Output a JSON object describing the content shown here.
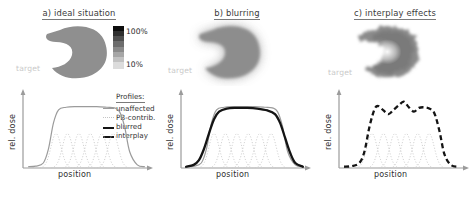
{
  "figure": {
    "panels": [
      {
        "id": "a",
        "title": "a) ideal situation",
        "target_label": "target",
        "axis": {
          "x": "position",
          "y": "rel. dose"
        }
      },
      {
        "id": "b",
        "title": "b) blurring",
        "target_label": "target",
        "axis": {
          "x": "position",
          "y": "rel. dose"
        }
      },
      {
        "id": "c",
        "title": "c) interplay effects",
        "target_label": "target",
        "axis": {
          "x": "position",
          "y": "rel. dose"
        }
      }
    ],
    "colorbar": {
      "max_label": "100%",
      "min_label": "10%",
      "max_color": "#0d0d0d",
      "min_color": "#dcdcdc"
    },
    "legend": {
      "title": "Profiles:",
      "items": [
        {
          "label": "unaffected",
          "style": "solid-thin-gray",
          "color": "#9b9b9b"
        },
        {
          "label": "PB-contrib.",
          "style": "dotted-thin-light",
          "color": "#c4c4c4"
        },
        {
          "label": "blurred",
          "style": "solid-thick-black",
          "color": "#141414"
        },
        {
          "label": "interplay",
          "style": "dashed-thick-black",
          "color": "#141414"
        }
      ]
    }
  },
  "chart_data": [
    {
      "type": "line",
      "panel": "a",
      "title": "a) ideal situation",
      "xlabel": "position",
      "ylabel": "rel. dose",
      "xlim": [
        0,
        100
      ],
      "ylim": [
        0,
        1.15
      ],
      "grid": false,
      "legend_position": "right",
      "series": [
        {
          "name": "unaffected",
          "style": "solid-thin-gray",
          "x": [
            4,
            10,
            16,
            20,
            24,
            28,
            34,
            42,
            50,
            58,
            66,
            72,
            76,
            80,
            84,
            90,
            96
          ],
          "values": [
            0.02,
            0.03,
            0.08,
            0.3,
            0.72,
            0.93,
            0.97,
            0.98,
            0.98,
            0.98,
            0.97,
            0.96,
            0.9,
            0.66,
            0.26,
            0.05,
            0.02
          ]
        },
        {
          "name": "PB-contrib.",
          "style": "dotted-thin-light",
          "centers": [
            26,
            35,
            44,
            53,
            62,
            71
          ],
          "peak": 0.55,
          "sigma": 4.0
        }
      ]
    },
    {
      "type": "line",
      "panel": "b",
      "title": "b) blurring",
      "xlabel": "position",
      "ylabel": "rel. dose",
      "xlim": [
        0,
        100
      ],
      "ylim": [
        0,
        1.15
      ],
      "grid": false,
      "legend_position": "none",
      "series": [
        {
          "name": "unaffected",
          "style": "solid-thin-gray",
          "x": [
            4,
            10,
            16,
            20,
            24,
            28,
            34,
            42,
            50,
            58,
            66,
            72,
            76,
            80,
            84,
            90,
            96
          ],
          "values": [
            0.02,
            0.03,
            0.08,
            0.3,
            0.72,
            0.93,
            0.97,
            0.98,
            0.98,
            0.98,
            0.97,
            0.96,
            0.9,
            0.66,
            0.26,
            0.05,
            0.02
          ]
        },
        {
          "name": "PB-contrib.",
          "style": "dotted-thin-light",
          "centers": [
            26,
            35,
            44,
            53,
            62,
            71
          ],
          "peak": 0.55,
          "sigma": 4.0
        },
        {
          "name": "blurred",
          "style": "solid-thick-black",
          "x": [
            4,
            10,
            14,
            18,
            22,
            26,
            30,
            36,
            44,
            52,
            60,
            68,
            74,
            78,
            82,
            86,
            90,
            96
          ],
          "values": [
            0.02,
            0.05,
            0.12,
            0.3,
            0.55,
            0.78,
            0.9,
            0.95,
            0.96,
            0.96,
            0.95,
            0.92,
            0.86,
            0.72,
            0.48,
            0.24,
            0.08,
            0.02
          ]
        }
      ]
    },
    {
      "type": "line",
      "panel": "c",
      "title": "c) interplay effects",
      "xlabel": "position",
      "ylabel": "rel. dose",
      "xlim": [
        0,
        100
      ],
      "ylim": [
        0,
        1.15
      ],
      "grid": false,
      "legend_position": "none",
      "series": [
        {
          "name": "PB-contrib.",
          "style": "dotted-thin-light",
          "centers": [
            26,
            35,
            44,
            53,
            62,
            71
          ],
          "peak": 0.55,
          "sigma": 4.0
        },
        {
          "name": "interplay",
          "style": "dashed-thick-black",
          "x": [
            4,
            10,
            16,
            20,
            24,
            28,
            31,
            35,
            39,
            43,
            47,
            51,
            55,
            59,
            63,
            67,
            71,
            75,
            79,
            83,
            88,
            94
          ],
          "values": [
            0.02,
            0.03,
            0.08,
            0.26,
            0.66,
            0.94,
            0.99,
            0.92,
            0.86,
            0.93,
            1.0,
            1.06,
            0.97,
            0.9,
            0.96,
            0.97,
            0.95,
            0.88,
            0.6,
            0.22,
            0.05,
            0.02
          ]
        }
      ]
    }
  ]
}
